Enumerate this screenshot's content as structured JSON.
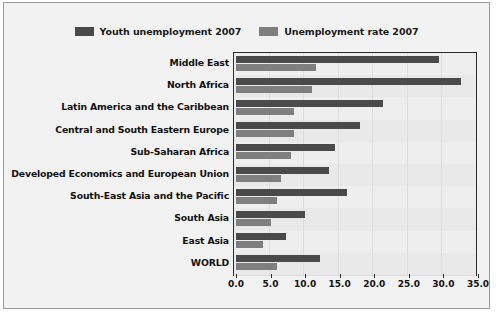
{
  "chart_data": {
    "type": "bar",
    "orientation": "horizontal",
    "title": "",
    "subtitle": "",
    "xlabel": "",
    "ylabel": "",
    "xlim": [
      0.0,
      35.0
    ],
    "xticks": [
      "0.0",
      "5.0",
      "10.0",
      "15.0",
      "20.0",
      "25.0",
      "30.0",
      "35.0"
    ],
    "xtick_values": [
      0,
      5,
      10,
      15,
      20,
      25,
      30,
      35
    ],
    "grid": true,
    "legend_position": "top-center",
    "categories": [
      "Middle East",
      "North Africa",
      "Latin America and the Caribbean",
      "Central and South Eastern Europe",
      "Sub-Saharan Africa",
      "Developed Economics and European Union",
      "South-East Asia and the Pacific",
      "South Asia",
      "East Asia",
      "WORLD"
    ],
    "series": [
      {
        "name": "Youth unemployment 2007",
        "color": "#4a4a4a",
        "values": [
          29.4,
          32.6,
          21.2,
          18.0,
          14.3,
          13.4,
          16.1,
          10.0,
          7.2,
          12.1
        ]
      },
      {
        "name": "Unemployment rate 2007",
        "color": "#7f7f7f",
        "values": [
          11.6,
          11.0,
          8.4,
          8.4,
          7.9,
          6.5,
          6.0,
          5.1,
          3.9,
          6.0
        ]
      }
    ]
  },
  "legend": {
    "entries": [
      {
        "label": "Youth unemployment 2007",
        "color": "#4a4a4a"
      },
      {
        "label": "Unemployment rate 2007",
        "color": "#7f7f7f"
      }
    ]
  },
  "colors": {
    "youth_bar": "#4a4a4a",
    "rate_bar": "#7f7f7f",
    "plot_background": "#ededed",
    "card_background": "#f2f2f2",
    "axis": "#2b2b2b",
    "gridline": "#dcdcdc"
  }
}
